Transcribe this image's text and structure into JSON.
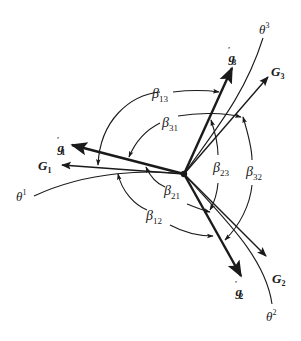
{
  "diagram": {
    "colors": {
      "ink": "#1a1a1a",
      "background": "#ffffff"
    },
    "origin": {
      "x": 184,
      "y": 174
    },
    "coordinate_lines": [
      {
        "id": "theta1",
        "symbol": "θ",
        "superscript": "1"
      },
      {
        "id": "theta2",
        "symbol": "θ",
        "superscript": "2"
      },
      {
        "id": "theta3",
        "symbol": "θ",
        "superscript": "3"
      }
    ],
    "covariant_vectors": [
      {
        "id": "G1",
        "symbol": "G",
        "subscript": "1"
      },
      {
        "id": "G2",
        "symbol": "G",
        "subscript": "2"
      },
      {
        "id": "G3",
        "symbol": "G",
        "subscript": "3"
      }
    ],
    "deformed_vectors": [
      {
        "id": "g1p",
        "symbol": "g",
        "prime": "′",
        "subscript": "1"
      },
      {
        "id": "g2p",
        "symbol": "g",
        "prime": "′",
        "subscript": "2"
      },
      {
        "id": "g3p",
        "symbol": "g",
        "prime": "′",
        "subscript": "3"
      }
    ],
    "angles": [
      {
        "id": "b13",
        "symbol": "β",
        "subscript": "13"
      },
      {
        "id": "b31",
        "symbol": "β",
        "subscript": "31"
      },
      {
        "id": "b21",
        "symbol": "β",
        "subscript": "21"
      },
      {
        "id": "b12",
        "symbol": "β",
        "subscript": "12"
      },
      {
        "id": "b23",
        "symbol": "β",
        "subscript": "23"
      },
      {
        "id": "b32",
        "symbol": "β",
        "subscript": "32"
      }
    ]
  }
}
